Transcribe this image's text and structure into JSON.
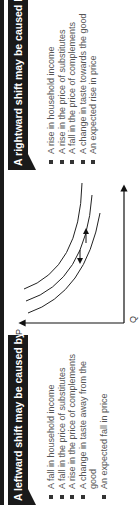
{
  "left_panel": {
    "title": "A leftward shift may be caused by",
    "items": [
      "A fall in household income",
      "A fall in the price of substitutes",
      "A rise in the price of complements",
      "A change in taste away from the good",
      "An expected fall in price"
    ]
  },
  "right_panel": {
    "title": "A rightward shift may be caused by",
    "items": [
      "A rise in household income",
      "A rise in the price of substitutes",
      "A fall in the price of complements",
      "A change in taste towards the good",
      "An expected rise in price"
    ]
  },
  "graph": {
    "y_label": "P",
    "x_label": "Q",
    "curves": [
      "D-left",
      "D",
      "D-right"
    ],
    "arrows": [
      "shift-left",
      "shift-right"
    ]
  },
  "colors": {
    "header_bg": "#1a1a1a",
    "header_text": "#ffffff",
    "body_text": "#555555"
  }
}
